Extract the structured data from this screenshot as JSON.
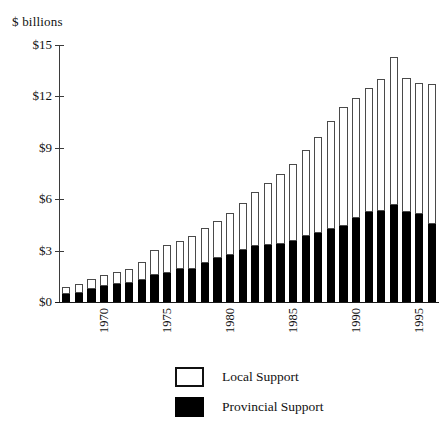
{
  "chart_data": {
    "type": "bar",
    "subtype": "stacked-bar",
    "title": "",
    "xlabel": "",
    "ylabel": "$ billions",
    "ylim": [
      0,
      15
    ],
    "yticks": [
      0,
      3,
      6,
      9,
      12,
      15
    ],
    "ytick_labels": [
      "$0",
      "$3",
      "$6",
      "$9",
      "$12",
      "$15"
    ],
    "grid": false,
    "legend_position": "bottom",
    "categories": [
      1968,
      1969,
      1970,
      1971,
      1972,
      1973,
      1974,
      1975,
      1976,
      1977,
      1978,
      1979,
      1980,
      1981,
      1982,
      1983,
      1984,
      1985,
      1986,
      1987,
      1988,
      1989,
      1990,
      1991,
      1992,
      1993,
      1994,
      1995,
      1996,
      1997
    ],
    "xtick_labels": [
      "1970",
      "1975",
      "1980",
      "1985",
      "1990",
      "1995"
    ],
    "xtick_categories": [
      1970,
      1975,
      1980,
      1985,
      1990,
      1995
    ],
    "series": [
      {
        "name": "Provincial Support",
        "color": "#000000",
        "values": [
          0.45,
          0.55,
          0.75,
          0.95,
          1.05,
          1.1,
          1.3,
          1.55,
          1.7,
          1.9,
          1.95,
          2.25,
          2.55,
          2.75,
          3.05,
          3.25,
          3.3,
          3.4,
          3.55,
          3.85,
          4.05,
          4.25,
          4.45,
          4.9,
          5.25,
          5.3,
          5.65,
          5.25,
          5.15,
          4.55
        ]
      },
      {
        "name": "Local Support",
        "color": "#ffffff",
        "values": [
          0.45,
          0.5,
          0.6,
          0.65,
          0.7,
          0.8,
          1.05,
          1.5,
          1.6,
          1.65,
          1.9,
          2.05,
          2.15,
          2.45,
          2.75,
          3.15,
          3.65,
          4.05,
          4.5,
          5.0,
          5.6,
          6.3,
          6.95,
          7.0,
          7.25,
          7.7,
          8.65,
          7.8,
          7.65,
          8.15
        ]
      }
    ],
    "totals": [
      0.9,
      1.05,
      1.35,
      1.6,
      1.75,
      1.9,
      2.35,
      3.05,
      3.3,
      3.55,
      3.85,
      4.3,
      4.7,
      5.2,
      5.8,
      6.4,
      6.95,
      7.45,
      8.05,
      8.85,
      9.65,
      10.55,
      11.4,
      11.9,
      12.5,
      13.0,
      14.3,
      13.05,
      12.8,
      12.7
    ]
  },
  "legend": {
    "items": [
      {
        "label": "Local Support",
        "swatch": "local"
      },
      {
        "label": "Provincial Support",
        "swatch": "prov"
      }
    ]
  }
}
